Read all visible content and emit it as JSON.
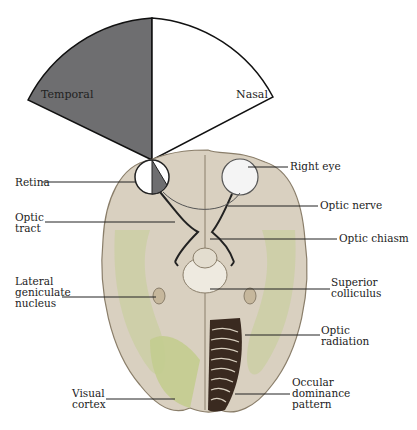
{
  "figure": {
    "visual_field": {
      "left_sector_label": "Temporal",
      "right_sector_label": "Nasal",
      "colors": {
        "temporal_fill": "#6e6e70",
        "nasal_fill": "#ffffff",
        "outline": "#111111"
      }
    },
    "labels": {
      "retina": "Retina",
      "optic_tract": [
        "Optic",
        "tract"
      ],
      "lateral_geniculate_nucleus": [
        "Lateral",
        "geniculate",
        "nucleus"
      ],
      "visual_cortex": [
        "Visual",
        "cortex"
      ],
      "right_eye": "Right eye",
      "optic_nerve": "Optic nerve",
      "optic_chiasm": "Optic chiasm",
      "superior_colliculus": [
        "Superior",
        "colliculus"
      ],
      "optic_radiation": [
        "Optic",
        "radiation"
      ],
      "ocular_dominance_pattern": [
        "Occular",
        "dominance",
        "pattern"
      ]
    },
    "colors": {
      "brain_fill": "#d9d0c0",
      "brain_shadow": "#a89c88",
      "cortex_green": "#c9cfa0",
      "ocular_pattern": "#3a2a20",
      "leader_line": "#222222"
    }
  }
}
